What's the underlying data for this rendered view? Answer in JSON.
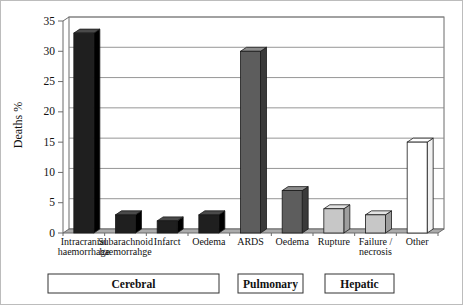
{
  "figure": {
    "background": "#ffffff",
    "border_color": "#bcbcbc"
  },
  "chart_data": {
    "type": "bar",
    "style": "3d-column",
    "title": "",
    "xlabel": "",
    "ylabel": "Deaths %",
    "ylim": [
      0,
      35
    ],
    "ytick_step": 5,
    "yticks": [
      0,
      5,
      10,
      15,
      20,
      25,
      30,
      35
    ],
    "grid": true,
    "legend": "none",
    "categories": [
      "Intracranial\nhaemorrhage",
      "Subarachnoid\nhaemorrahge",
      "Infarct",
      "Oedema",
      "ARDS",
      "Oedema",
      "Rupture",
      "Failure /\nnecrosis",
      "Other"
    ],
    "values": [
      33,
      3,
      2,
      3,
      30,
      7,
      4,
      3,
      15
    ],
    "bar_color_keys": [
      "cerebral",
      "cerebral",
      "cerebral",
      "cerebral",
      "pulmonary",
      "pulmonary",
      "hepatic",
      "hepatic",
      "other"
    ],
    "palette": {
      "cerebral": {
        "front": "#1f1f1f",
        "top": "#4a4a4a",
        "side": "#000000"
      },
      "pulmonary": {
        "front": "#5d5d5d",
        "top": "#8c8c8c",
        "side": "#3a3a3a"
      },
      "hepatic": {
        "front": "#c7c7c7",
        "top": "#e3e3e3",
        "side": "#9e9e9e"
      },
      "other": {
        "front": "#ffffff",
        "top": "#ffffff",
        "side": "#f2f2f2"
      }
    },
    "colors": {
      "gridline": "#8a8a8a",
      "frame": "#6b6b6b",
      "floor": "#ababab",
      "bar_outline": "#1a1a1a"
    },
    "group_boxes": [
      {
        "label": "Cerebral",
        "span": [
          0,
          3
        ]
      },
      {
        "label": "Pulmonary",
        "span": [
          4,
          5
        ]
      },
      {
        "label": "Hepatic",
        "span": [
          6,
          7
        ]
      }
    ]
  }
}
